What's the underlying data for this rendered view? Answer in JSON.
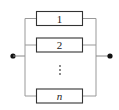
{
  "diagram": {
    "type": "parallel-system-block-diagram",
    "components": [
      {
        "label": "1",
        "italic": false
      },
      {
        "label": "2",
        "italic": false
      },
      {
        "label": "n",
        "italic": true
      }
    ],
    "ellipsis": "⋮",
    "colors": {
      "box_stroke": "#333333",
      "line": "#888888",
      "node": "#111111",
      "background": "#ffffff"
    }
  }
}
